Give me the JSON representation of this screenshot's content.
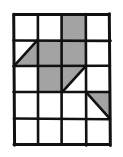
{
  "figure": {
    "type": "grid-shading-diagram",
    "colors": {
      "background": "#ffffff",
      "grid_line": "#111111",
      "shade_fill": "#a3a3a3",
      "shade_stroke": "#111111"
    },
    "grid": {
      "columns": 4,
      "rows": 5,
      "left": 14,
      "top": 14,
      "right": 110,
      "bottom": 145,
      "cell_width": 24,
      "cell_height": 26.2,
      "column_x": [
        14,
        38,
        62,
        86,
        110
      ],
      "row_y": [
        14,
        40.2,
        66.4,
        92.6,
        118.8,
        145
      ],
      "line_width": 2.6,
      "outer_line_width": 3.0
    },
    "shaded_cells": [
      {
        "name": "r1c3",
        "row": 1,
        "col": 3,
        "shape": "full"
      },
      {
        "name": "r2c1",
        "row": 2,
        "col": 1,
        "shape": "triangle-lower-right"
      },
      {
        "name": "r2c2",
        "row": 2,
        "col": 2,
        "shape": "full"
      },
      {
        "name": "r2c3",
        "row": 2,
        "col": 3,
        "shape": "full"
      },
      {
        "name": "r3c2",
        "row": 3,
        "col": 2,
        "shape": "full"
      },
      {
        "name": "r3c3",
        "row": 3,
        "col": 3,
        "shape": "triangle-upper-left"
      },
      {
        "name": "r4c2",
        "row": 4,
        "col": 4,
        "shape": "triangle-upper-right"
      }
    ],
    "unshaded_rows": [
      5
    ],
    "counts": {
      "full_squares": 4,
      "half_squares": 3,
      "total_area_in_squares": 5.5
    },
    "labels": {
      "figure_label": "",
      "caption": ""
    }
  }
}
